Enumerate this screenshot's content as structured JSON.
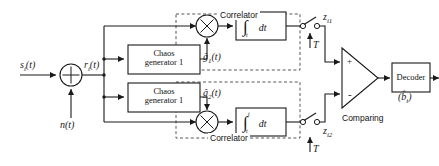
{
  "figure": {
    "type": "block-diagram"
  },
  "signals": {
    "input_label": "s",
    "input_sub": "i",
    "input_arg": "(t)",
    "noise_label": "n",
    "noise_arg": "(t)",
    "received_label": "r",
    "received_sub": "i",
    "received_arg": "(t)",
    "ghat1_label": "ĝ",
    "ghat1_sub": "1",
    "ghat1_arg": "(t)",
    "ghat2_label": "ĝ",
    "ghat2_sub": "2",
    "ghat2_arg": "(t)",
    "z1_label": "z",
    "z1_sub": "i1",
    "z2_label": "z",
    "z2_sub": "i2",
    "sample_clock_top": "T",
    "sample_clock_bottom": "T",
    "output_label": "(b̂",
    "output_sub": "i",
    "output_close": ")"
  },
  "blocks": {
    "chaos_gen_1": {
      "line1": "Chaos",
      "line2": "generator 1"
    },
    "chaos_gen_2": {
      "line1": "Chaos",
      "line2": "generator 1"
    },
    "integrator_top": {
      "symbol": "∫",
      "upper_limit": "t",
      "lower_limit": "t",
      "body": "dt"
    },
    "integrator_bottom": {
      "symbol": "∫",
      "upper_limit": "t",
      "lower_limit": "t",
      "body": "dt"
    },
    "decoder": {
      "label": "Decoder"
    }
  },
  "groups": {
    "correlator_top": {
      "title": "Correlator"
    },
    "correlator_bottom": {
      "title": "Correlator"
    }
  },
  "comparator": {
    "caption": "Comparing",
    "plus": "+",
    "minus": "-"
  },
  "summing_node": {
    "symbol": "+"
  },
  "colors": {
    "line": "#1a1a1a",
    "dashed": "#555555",
    "text": "#111111",
    "background": "#ffffff"
  }
}
